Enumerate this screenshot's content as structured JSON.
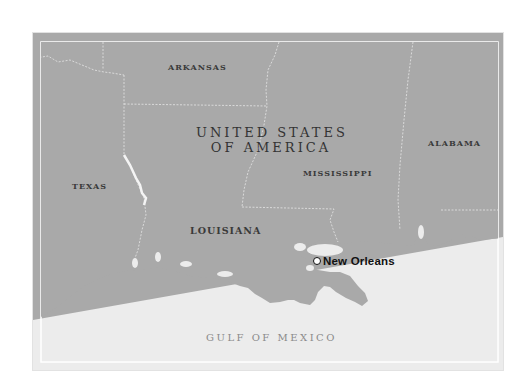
{
  "map": {
    "colors": {
      "land": "#a9a9a9",
      "water": "#ececec",
      "border_line": "#e6e6e6",
      "frame_line": "#ffffff",
      "label_text": "#3a3a3a",
      "water_text": "#8a8a8a",
      "city_text": "#111111"
    },
    "country": {
      "line1": "United States",
      "line2": "of America"
    },
    "states": [
      {
        "name": "Arkansas"
      },
      {
        "name": "Texas"
      },
      {
        "name": "Louisiana"
      },
      {
        "name": "Mississippi"
      },
      {
        "name": "Alabama"
      }
    ],
    "water_body": "Gulf of Mexico",
    "city": {
      "name": "New Orleans",
      "marker": "circle-marker-icon"
    }
  }
}
